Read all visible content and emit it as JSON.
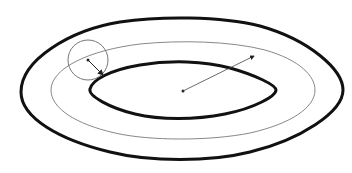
{
  "diagram": {
    "background": "#ffffff",
    "stroke_color": "#111111",
    "thin_stroke_color": "#888888",
    "shapes": {
      "outer_curve": {
        "style": "thick",
        "left": 21,
        "right": 343,
        "top": 18,
        "bottom": 161
      },
      "middle_curve": {
        "style": "thin",
        "left": 51,
        "right": 315,
        "top": 42,
        "bottom": 140
      },
      "inner_curve": {
        "style": "thick",
        "left": 90,
        "right": 276,
        "top": 62,
        "bottom": 118
      },
      "small_circle": {
        "cx": 88,
        "cy": 60,
        "r": 20
      },
      "center_point": {
        "x": 183,
        "y": 91
      }
    },
    "arrows": [
      {
        "name": "small-circle-radius",
        "from": [
          88,
          60
        ],
        "to": [
          104,
          76
        ]
      },
      {
        "name": "center-to-middle-curve",
        "from": [
          183,
          91
        ],
        "to": [
          255,
          55
        ]
      }
    ]
  }
}
